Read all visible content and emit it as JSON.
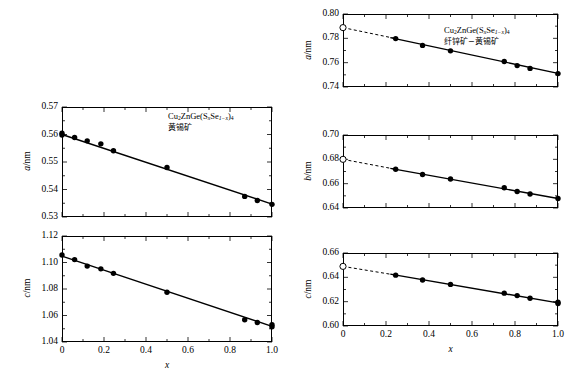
{
  "figure": {
    "width": 583,
    "height": 388,
    "background": "#ffffff",
    "line_color": "#000000",
    "marker_filled_color": "#000000",
    "marker_open_fill": "#ffffff"
  },
  "axis_titles": {
    "x": "x",
    "a": "a/nm",
    "b": "b/nm",
    "c": "c/nm"
  },
  "annotations": {
    "left": {
      "formula_pre": "Cu",
      "formula_sub1": "2",
      "formula_mid": "ZnGe(S",
      "formula_subx": "x",
      "formula_se": "Se",
      "formula_sub1mx": "1−x",
      "formula_close": ")",
      "formula_sub4": "4",
      "full_formula": "Cu2ZnGe(SxSe1−x)4",
      "phase": "黄锡矿"
    },
    "right": {
      "full_formula": "Cu2ZnGe(SxSe1−x)4",
      "phase": "纤锌矿−黄锡矿"
    }
  },
  "chart_data": [
    {
      "id": "left-a",
      "type": "scatter",
      "title": "",
      "xlabel": "",
      "ylabel": "a/nm",
      "xlim": [
        0,
        1.0
      ],
      "ylim": [
        0.53,
        0.57
      ],
      "xticks": [
        0,
        0.2,
        0.4,
        0.6,
        0.8,
        1.0
      ],
      "xticklabels": [
        "",
        "",
        "",
        "",
        "",
        ""
      ],
      "yticks": [
        0.53,
        0.54,
        0.55,
        0.56,
        0.57
      ],
      "yticklabels": [
        "0.53",
        "0.54",
        "0.55",
        "0.56",
        "0.57"
      ],
      "grid": false,
      "legend": "none",
      "x": [
        0.0,
        0.0,
        0.06,
        0.12,
        0.185,
        0.245,
        0.5,
        0.87,
        0.93,
        1.0
      ],
      "values": [
        0.5605,
        0.5598,
        0.5589,
        0.5577,
        0.5566,
        0.5541,
        0.548,
        0.5375,
        0.536,
        0.5346
      ],
      "open_marker": null,
      "fit_line": {
        "x": [
          0.0,
          1.0
        ],
        "y": [
          0.56,
          0.5347
        ]
      },
      "dashed_extrapolation": null
    },
    {
      "id": "left-c",
      "type": "scatter",
      "title": "",
      "xlabel": "x",
      "ylabel": "c/nm",
      "xlim": [
        0,
        1.0
      ],
      "ylim": [
        1.04,
        1.12
      ],
      "xticks": [
        0,
        0.2,
        0.4,
        0.6,
        0.8,
        1.0
      ],
      "xticklabels": [
        "0",
        "0.2",
        "0.4",
        "0.6",
        "0.8",
        "1.0"
      ],
      "yticks": [
        1.04,
        1.06,
        1.08,
        1.1,
        1.12
      ],
      "yticklabels": [
        "1.04",
        "1.06",
        "1.08",
        "1.10",
        "1.12"
      ],
      "grid": false,
      "legend": "none",
      "x": [
        0.0,
        0.06,
        0.12,
        0.185,
        0.245,
        0.5,
        0.87,
        0.93,
        1.0,
        1.0
      ],
      "values": [
        1.1057,
        1.1022,
        1.0973,
        1.0952,
        1.0918,
        1.0775,
        1.0568,
        1.0547,
        1.053,
        1.0515
      ],
      "open_marker": null,
      "fit_line": {
        "x": [
          0.0,
          1.0
        ],
        "y": [
          1.1048,
          1.0518
        ]
      },
      "dashed_extrapolation": null
    },
    {
      "id": "right-a",
      "type": "scatter",
      "title": "",
      "xlabel": "",
      "ylabel": "a/nm",
      "xlim": [
        0,
        1.0
      ],
      "ylim": [
        0.74,
        0.8
      ],
      "xticks": [
        0,
        0.2,
        0.4,
        0.6,
        0.8,
        1.0
      ],
      "xticklabels": [
        "",
        "",
        "",
        "",
        "",
        ""
      ],
      "yticks": [
        0.74,
        0.76,
        0.78,
        0.8
      ],
      "yticklabels": [
        "0.74",
        "0.76",
        "0.78",
        "0.80"
      ],
      "grid": false,
      "legend": "none",
      "x": [
        0.245,
        0.37,
        0.5,
        0.75,
        0.81,
        0.87,
        1.0
      ],
      "values": [
        0.7798,
        0.7742,
        0.7697,
        0.7609,
        0.7576,
        0.7553,
        0.751
      ],
      "open_marker": {
        "x": 0.0,
        "y": 0.7888
      },
      "fit_line": {
        "x": [
          0.22,
          1.0
        ],
        "y": [
          0.7806,
          0.7512
        ]
      },
      "dashed_extrapolation": {
        "x": [
          0.0,
          0.24
        ],
        "y": [
          0.7888,
          0.78
        ]
      }
    },
    {
      "id": "right-b",
      "type": "scatter",
      "title": "",
      "xlabel": "",
      "ylabel": "b/nm",
      "xlim": [
        0,
        1.0
      ],
      "ylim": [
        0.64,
        0.7
      ],
      "xticks": [
        0,
        0.2,
        0.4,
        0.6,
        0.8,
        1.0
      ],
      "xticklabels": [
        "",
        "",
        "",
        "",
        "",
        ""
      ],
      "yticks": [
        0.64,
        0.66,
        0.68,
        0.7
      ],
      "yticklabels": [
        "0.64",
        "0.66",
        "0.68",
        "0.70"
      ],
      "grid": false,
      "legend": "none",
      "x": [
        0.245,
        0.37,
        0.5,
        0.75,
        0.81,
        0.87,
        1.0
      ],
      "values": [
        0.6718,
        0.6675,
        0.6638,
        0.6566,
        0.6536,
        0.6515,
        0.6478
      ],
      "open_marker": {
        "x": 0.0,
        "y": 0.68
      },
      "fit_line": {
        "x": [
          0.22,
          1.0
        ],
        "y": [
          0.6726,
          0.6478
        ]
      },
      "dashed_extrapolation": {
        "x": [
          0.0,
          0.24
        ],
        "y": [
          0.68,
          0.672
        ]
      }
    },
    {
      "id": "right-c",
      "type": "scatter",
      "title": "",
      "xlabel": "x",
      "ylabel": "c/nm",
      "xlim": [
        0,
        1.0
      ],
      "ylim": [
        0.6,
        0.66
      ],
      "xticks": [
        0,
        0.2,
        0.4,
        0.6,
        0.8,
        1.0
      ],
      "xticklabels": [
        "0",
        "0.2",
        "0.4",
        "0.6",
        "0.8",
        "1.0"
      ],
      "yticks": [
        0.6,
        0.62,
        0.64,
        0.66
      ],
      "yticklabels": [
        "0.60",
        "0.62",
        "0.64",
        "0.66"
      ],
      "grid": false,
      "legend": "none",
      "x": [
        0.245,
        0.37,
        0.5,
        0.75,
        0.81,
        0.87,
        1.0,
        1.0
      ],
      "values": [
        0.6418,
        0.6378,
        0.6342,
        0.627,
        0.625,
        0.6228,
        0.6195,
        0.6185
      ],
      "open_marker": {
        "x": 0.0,
        "y": 0.649
      },
      "fit_line": {
        "x": [
          0.22,
          1.0
        ],
        "y": [
          0.6426,
          0.619
        ]
      },
      "dashed_extrapolation": {
        "x": [
          0.0,
          0.24
        ],
        "y": [
          0.649,
          0.642
        ]
      }
    }
  ]
}
